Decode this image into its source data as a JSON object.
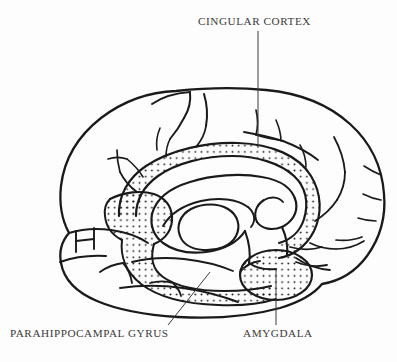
{
  "figure": {
    "type": "anatomical-line-diagram",
    "view": "medial sagittal (left hemisphere), anterior to the left",
    "background_color": "#fdfdfd",
    "ink_color": "#1a1a1a",
    "text_color": "#3a3a3a",
    "stipple": {
      "description": "regular square dot grid marking the limbic lobe",
      "dot_color": "#1a1a1a",
      "dot_radius_px": 0.95,
      "spacing_px": 6.2
    },
    "shaded_regions": [
      "cingulate gyrus band arching over the corpus callosum",
      "parahippocampal gyrus along the medial temporal lobe",
      "amygdala oval at the anterior temporal region"
    ]
  },
  "labels": {
    "cingular_cortex": {
      "text": "CINGULAR CORTEX",
      "leader": "vertical line descending from label to the shaded cingulate band"
    },
    "parahippocampal_gyrus": {
      "text": "PARAHIPPOCAMPAL GYRUS",
      "leader": "diagonal line rising to the right toward the medial temporal shading"
    },
    "amygdala": {
      "text": "AMYGDALA",
      "leader": "vertical line rising from label into the stippled amygdala oval"
    }
  }
}
